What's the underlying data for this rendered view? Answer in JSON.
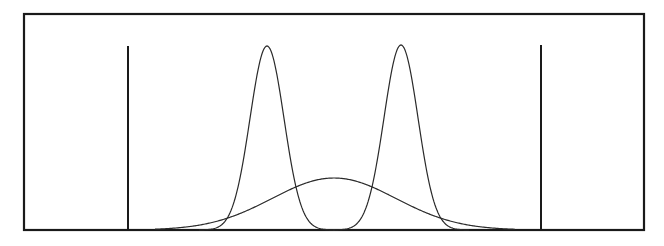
{
  "figure": {
    "width": 664,
    "height": 246,
    "background": "#ffffff",
    "frame": {
      "x": 24,
      "y": 14,
      "width": 620,
      "height": 216,
      "stroke": "#1a1a1a",
      "stroke_width": 2.2
    },
    "baseline_y": 230,
    "stroke_color": "#2a2a2a"
  },
  "chart_data": {
    "type": "line",
    "title": "",
    "xlabel": "",
    "ylabel": "",
    "grid": false,
    "legend": null,
    "vertical_lines": [
      {
        "name": "left-bound",
        "x_px": 128,
        "top_px": 46
      },
      {
        "name": "right-bound",
        "x_px": 541,
        "top_px": 45
      }
    ],
    "series": [
      {
        "name": "narrow-peak-left",
        "kind": "gaussian",
        "center_px": 267,
        "sigma_px": 17,
        "peak_y_px": 46
      },
      {
        "name": "narrow-peak-right",
        "kind": "gaussian",
        "center_px": 401,
        "sigma_px": 17,
        "peak_y_px": 45
      },
      {
        "name": "broad-peak",
        "kind": "gaussian",
        "center_px": 334,
        "sigma_px": 62,
        "peak_y_px": 178
      }
    ],
    "x_range_px": [
      155,
      515
    ]
  }
}
